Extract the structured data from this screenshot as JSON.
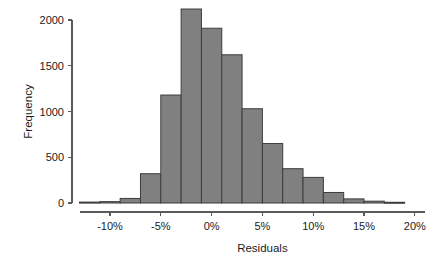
{
  "chart_data": {
    "type": "bar",
    "title": "",
    "subtitle": "",
    "xlabel": "Residuals",
    "ylabel": "Frequency",
    "grid": false,
    "legend": null,
    "bar_color": "#808080",
    "bar_edge_color": "#3d3d3d",
    "axis_color": "#5a5a5a",
    "text_color": "#1b1b1b",
    "bin_width_percent": 2,
    "xlim": [
      -13,
      20
    ],
    "ylim": [
      0,
      2200
    ],
    "xticks": [
      -10,
      -5,
      0,
      5,
      10,
      15,
      20
    ],
    "xtick_labels": [
      "-10%",
      "-5%",
      "0%",
      "5%",
      "10%",
      "15%",
      "20%"
    ],
    "yticks": [
      0,
      500,
      1000,
      1500,
      2000
    ],
    "ytick_labels": [
      "0",
      "500",
      "1000",
      "1500",
      "2000"
    ],
    "bins": [
      {
        "left": -13,
        "right": -11,
        "center": -12,
        "value": 10
      },
      {
        "left": -11,
        "right": -9,
        "center": -10,
        "value": 15
      },
      {
        "left": -9,
        "right": -7,
        "center": -8,
        "value": 50
      },
      {
        "left": -7,
        "right": -5,
        "center": -6,
        "value": 320
      },
      {
        "left": -5,
        "right": -3,
        "center": -4,
        "value": 1180
      },
      {
        "left": -3,
        "right": -1,
        "center": -2,
        "value": 2120
      },
      {
        "left": -1,
        "right": 1,
        "center": 0,
        "value": 1910
      },
      {
        "left": 1,
        "right": 3,
        "center": 2,
        "value": 1620
      },
      {
        "left": 3,
        "right": 5,
        "center": 4,
        "value": 1030
      },
      {
        "left": 5,
        "right": 7,
        "center": 6,
        "value": 650
      },
      {
        "left": 7,
        "right": 9,
        "center": 8,
        "value": 375
      },
      {
        "left": 9,
        "right": 11,
        "center": 10,
        "value": 280
      },
      {
        "left": 11,
        "right": 13,
        "center": 12,
        "value": 115
      },
      {
        "left": 13,
        "right": 15,
        "center": 14,
        "value": 45
      },
      {
        "left": 15,
        "right": 17,
        "center": 16,
        "value": 20
      },
      {
        "left": 17,
        "right": 19,
        "center": 18,
        "value": 8
      }
    ],
    "categories": [
      "-12%",
      "-10%",
      "-8%",
      "-6%",
      "-4%",
      "-2%",
      "0%",
      "2%",
      "4%",
      "6%",
      "8%",
      "10%",
      "12%",
      "14%",
      "16%",
      "18%"
    ],
    "values": [
      10,
      15,
      50,
      320,
      1180,
      2120,
      1910,
      1620,
      1030,
      650,
      375,
      280,
      115,
      45,
      20,
      8
    ]
  }
}
